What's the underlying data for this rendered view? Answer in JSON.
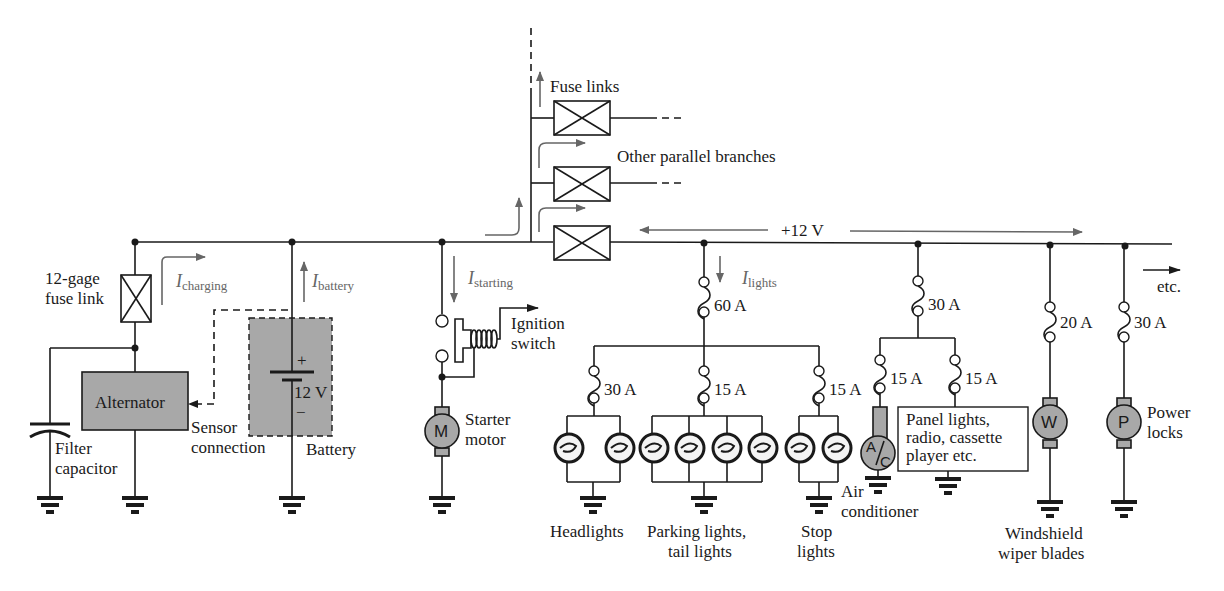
{
  "diagram": {
    "type": "automotive-electrical-system",
    "bus_voltage_label": "+12 V",
    "etc_label": "etc.",
    "fuse_links_label": "Fuse links",
    "other_branches_label": "Other parallel branches",
    "left_section": {
      "fuse_link_label_line1": "12-gage",
      "fuse_link_label_line2": "fuse link",
      "filter_capacitor_line1": "Filter",
      "filter_capacitor_line2": "capacitor",
      "alternator_label": "Alternator",
      "sensor_line1": "Sensor",
      "sensor_line2": "connection",
      "battery_label": "Battery",
      "battery_plus": "+",
      "battery_minus": "−",
      "battery_voltage": "12 V",
      "i_charging": {
        "main": "I",
        "sub": "charging"
      },
      "i_battery": {
        "main": "I",
        "sub": "battery"
      }
    },
    "starter": {
      "i_starting": {
        "main": "I",
        "sub": "starting"
      },
      "ignition_line1": "Ignition",
      "ignition_line2": "switch",
      "motor_symbol": "M",
      "motor_line1": "Starter",
      "motor_line2": "motor"
    },
    "lights": {
      "i_lights": {
        "main": "I",
        "sub": "lights"
      },
      "main_fuse": "60 A",
      "headlights_fuse": "30 A",
      "parking_fuse": "15 A",
      "stop_fuse": "15 A",
      "headlights_label": "Headlights",
      "parking_line1": "Parking lights,",
      "parking_line2": "tail lights",
      "stop_line1": "Stop",
      "stop_line2": "lights"
    },
    "accessories": {
      "main_fuse": "30 A",
      "ac_fuse": "15 A",
      "panel_fuse": "15 A",
      "ac_symbol_top": "A",
      "ac_symbol_bottom": "C",
      "ac_line1": "Air",
      "ac_line2": "conditioner",
      "panel_line1": "Panel lights,",
      "panel_line2": "radio, cassette",
      "panel_line3": "player etc."
    },
    "wiper": {
      "fuse": "20 A",
      "motor_symbol": "W",
      "line1": "Windshield",
      "line2": "wiper blades"
    },
    "locks": {
      "fuse": "30 A",
      "motor_symbol": "P",
      "line1": "Power",
      "line2": "locks"
    }
  }
}
